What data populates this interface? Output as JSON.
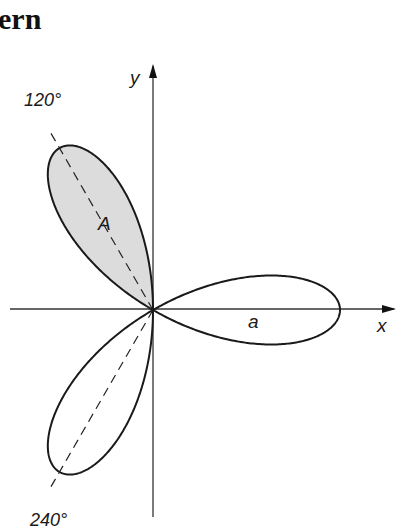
{
  "title_fragment": "ern",
  "diagram": {
    "type": "polar-rose",
    "equation_form": "r = a cos 3θ",
    "petals": 3,
    "origin": [
      153,
      310
    ],
    "a_px": 187,
    "axes": {
      "x_label": "x",
      "y_label": "y"
    },
    "petal_axes": [
      {
        "angle_deg": 120,
        "label": "120°"
      },
      {
        "angle_deg": 240,
        "label": "240°"
      }
    ],
    "labels": {
      "shaded_petal": "A",
      "right_petal": "a"
    },
    "colors": {
      "stroke": "#1a1a1a",
      "shaded_fill": "#dcdcdc",
      "axis": "#333333"
    }
  }
}
